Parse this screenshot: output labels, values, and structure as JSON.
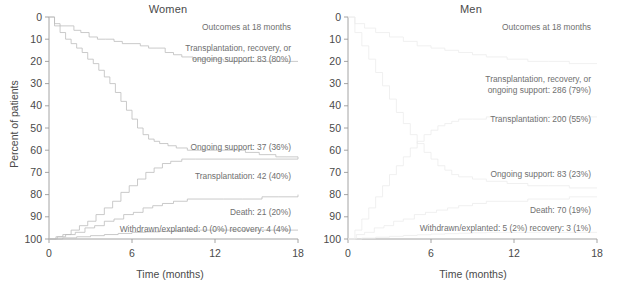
{
  "figure": {
    "axis_color": "#9a9a9a",
    "curve_color_women": "#bdbdbd",
    "curve_color_men": "#ececec",
    "text_color": "#4a4a4a",
    "annotation_color": "#6f6f6f"
  },
  "axes": {
    "ylabel": "Percent of patients",
    "xlabel": "Time (months)",
    "yticks": [
      "100",
      "90",
      "80",
      "70",
      "60",
      "50",
      "40",
      "30",
      "20",
      "10",
      "0"
    ],
    "xticks": [
      "0",
      "6",
      "12",
      "18"
    ]
  },
  "panels": {
    "women": {
      "title": "Women",
      "annotations": [
        {
          "text": "Outcomes at 18 months"
        },
        {
          "text": "Transplantation, recovery, or"
        },
        {
          "text": "ongoing support: 83 (80%)"
        },
        {
          "text": "Ongoing support: 37 (36%)"
        },
        {
          "text": "Transplantation: 42 (40%)"
        },
        {
          "text": "Death: 21 (20%)"
        },
        {
          "text": "Withdrawn/explanted: 0 (0%) recovery: 4 (4%)"
        }
      ]
    },
    "men": {
      "title": "Men",
      "annotations": [
        {
          "text": "Outcomes at 18 months"
        },
        {
          "text": "Transplantation, recovery, or"
        },
        {
          "text": "ongoing support: 286 (79%)"
        },
        {
          "text": "Transplantation: 200 (55%)"
        },
        {
          "text": "Ongoing support: 83 (23%)"
        },
        {
          "text": "Death: 70 (19%)"
        },
        {
          "text": "Withdrawn/explanted: 5 (2%) recovery: 3 (1%)"
        }
      ]
    }
  },
  "chart_data": {
    "type": "line",
    "xlabel": "Time (months)",
    "ylabel": "Percent of patients",
    "xlim": [
      0,
      18
    ],
    "ylim": [
      0,
      100
    ],
    "xticks": [
      0,
      6,
      12,
      18
    ],
    "yticks": [
      0,
      10,
      20,
      30,
      40,
      50,
      60,
      70,
      80,
      90,
      100
    ],
    "grid": false,
    "legend_position": "inline-annotations",
    "panels": [
      {
        "panel": "Women",
        "outcomes_at_18_months": {
          "transplantation_recovery_or_ongoing_support": {
            "n": 83,
            "percent": 80
          },
          "ongoing_support": {
            "n": 37,
            "percent": 36
          },
          "transplantation": {
            "n": 42,
            "percent": 40
          },
          "death": {
            "n": 21,
            "percent": 20
          },
          "withdrawn_explanted": {
            "n": 0,
            "percent": 0
          },
          "recovery": {
            "n": 4,
            "percent": 4
          }
        },
        "series": [
          {
            "name": "Transplantation, recovery, or ongoing support",
            "x": [
              0,
              0.4,
              0.8,
              1.3,
              1.8,
              2.3,
              2.9,
              3.5,
              4.1,
              4.7,
              5.3,
              6.0,
              6.6,
              7.2,
              7.8,
              8.4,
              9.0,
              9.6,
              10.4,
              11.4,
              12.6,
              14.0,
              15.4,
              16.6,
              18.0
            ],
            "y": [
              100,
              97,
              96,
              96,
              94,
              93,
              91,
              90,
              90,
              89,
              88,
              88,
              87,
              86,
              86,
              84,
              83,
              82,
              81,
              81,
              80,
              80,
              80,
              80,
              80
            ]
          },
          {
            "name": "Ongoing support",
            "x": [
              0,
              0.4,
              0.8,
              1.2,
              1.6,
              2.0,
              2.4,
              2.8,
              3.2,
              3.6,
              4.0,
              4.4,
              4.8,
              5.2,
              5.6,
              6.0,
              6.4,
              6.8,
              7.2,
              7.6,
              8.0,
              8.6,
              9.2,
              10.0,
              11.0,
              12.2,
              13.4,
              14.2,
              15.2,
              16.4,
              17.2,
              18.0
            ],
            "y": [
              100,
              96,
              93,
              90,
              88,
              86,
              84,
              81,
              79,
              76,
              73,
              70,
              66,
              62,
              58,
              54,
              50,
              47,
              45,
              44,
              43,
              42,
              41,
              40,
              40,
              40,
              40,
              39,
              38,
              37,
              37,
              36
            ]
          },
          {
            "name": "Transplantation",
            "x": [
              0,
              0.5,
              1.0,
              1.6,
              2.2,
              2.8,
              3.4,
              4.0,
              4.6,
              5.2,
              5.8,
              6.4,
              7.0,
              7.6,
              8.2,
              8.8,
              9.6,
              10.6,
              12.0,
              13.6,
              15.0,
              16.4,
              18.0
            ],
            "y": [
              0,
              1,
              2,
              4,
              6,
              8,
              11,
              14,
              17,
              21,
              24,
              27,
              30,
              32,
              34,
              35,
              36,
              36,
              36,
              36,
              36,
              36,
              36
            ]
          },
          {
            "name": "Death",
            "x": [
              0,
              0.6,
              1.2,
              1.9,
              2.6,
              3.3,
              4.0,
              4.7,
              5.4,
              6.1,
              6.8,
              7.5,
              8.2,
              9.0,
              10.0,
              11.2,
              12.6,
              14.0,
              15.4,
              16.6,
              18.0
            ],
            "y": [
              0,
              1,
              2,
              3,
              5,
              6,
              8,
              9,
              11,
              12,
              14,
              15,
              16,
              17,
              18,
              18,
              18,
              18,
              19,
              19,
              20
            ]
          },
          {
            "name": "Withdrawn/explanted and recovery",
            "x": [
              0,
              1.0,
              2.0,
              3.0,
              4.0,
              5.0,
              6.0,
              7.0,
              8.0,
              9.0,
              10.0,
              12.0,
              14.0,
              16.0,
              18.0
            ],
            "y": [
              0,
              0.5,
              1,
              1.5,
              2,
              2.5,
              3,
              3.2,
              3.5,
              3.7,
              4,
              4,
              4,
              4,
              4
            ]
          }
        ]
      },
      {
        "panel": "Men",
        "outcomes_at_18_months": {
          "transplantation_recovery_or_ongoing_support": {
            "n": 286,
            "percent": 79
          },
          "transplantation": {
            "n": 200,
            "percent": 55
          },
          "ongoing_support": {
            "n": 83,
            "percent": 23
          },
          "death": {
            "n": 70,
            "percent": 19
          },
          "withdrawn_explanted": {
            "n": 5,
            "percent": 2
          },
          "recovery": {
            "n": 3,
            "percent": 1
          }
        },
        "series": [
          {
            "name": "Transplantation, recovery, or ongoing support",
            "x": [
              0,
              0.5,
              1.2,
              2.0,
              3.0,
              4.0,
              5.0,
              6.0,
              7.0,
              8.0,
              9.0,
              10.0,
              11.5,
              13.0,
              14.5,
              16.0,
              18.0
            ],
            "y": [
              100,
              97,
              95,
              93,
              91,
              89,
              87,
              86,
              85,
              84,
              83,
              82,
              81,
              80,
              80,
              79,
              79
            ]
          },
          {
            "name": "Ongoing support",
            "x": [
              0,
              0.5,
              1.0,
              1.5,
              2.0,
              2.5,
              3.0,
              3.5,
              4.0,
              4.5,
              5.0,
              5.5,
              6.0,
              6.5,
              7.0,
              7.5,
              8.0,
              9.0,
              10.0,
              11.5,
              13.0,
              14.5,
              16.0,
              18.0
            ],
            "y": [
              100,
              93,
              87,
              81,
              75,
              69,
              63,
              57,
              52,
              47,
              43,
              39,
              36,
              33,
              31,
              29,
              28,
              27,
              26,
              25,
              24,
              24,
              23,
              23
            ]
          },
          {
            "name": "Transplantation",
            "x": [
              0,
              0.5,
              1.0,
              1.5,
              2.0,
              2.5,
              3.0,
              3.5,
              4.0,
              4.5,
              5.0,
              5.5,
              6.0,
              6.5,
              7.0,
              7.5,
              8.0,
              9.0,
              10.0,
              11.5,
              13.0,
              14.5,
              16.0,
              18.0
            ],
            "y": [
              0,
              4,
              9,
              14,
              19,
              24,
              29,
              33,
              37,
              41,
              44,
              47,
              49,
              51,
              52,
              53,
              54,
              54,
              55,
              55,
              55,
              55,
              55,
              55
            ]
          },
          {
            "name": "Death",
            "x": [
              0,
              0.6,
              1.2,
              1.9,
              2.6,
              3.3,
              4.0,
              4.8,
              5.6,
              6.4,
              7.2,
              8.0,
              9.0,
              10.0,
              11.5,
              13.0,
              14.5,
              16.0,
              18.0
            ],
            "y": [
              0,
              2,
              3,
              5,
              6,
              8,
              9,
              11,
              12,
              13,
              14,
              15,
              16,
              17,
              17,
              18,
              18,
              19,
              19
            ]
          },
          {
            "name": "Withdrawn/explanted and recovery",
            "x": [
              0,
              1.0,
              2.0,
              3.0,
              4.0,
              5.0,
              6.0,
              7.0,
              8.0,
              9.0,
              10.0,
              12.0,
              14.0,
              16.0,
              18.0
            ],
            "y": [
              0,
              0.4,
              0.8,
              1.2,
              1.6,
              1.9,
              2.2,
              2.4,
              2.6,
              2.8,
              3,
              3,
              3,
              3,
              3
            ]
          }
        ]
      }
    ]
  }
}
